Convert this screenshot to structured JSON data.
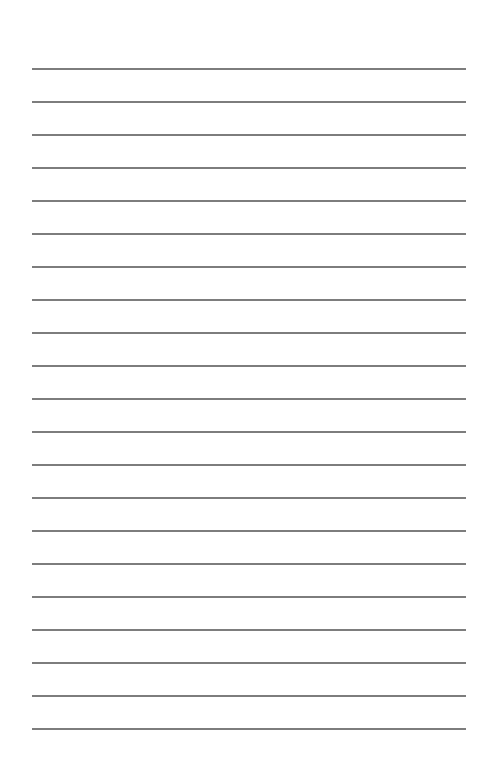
{
  "page": {
    "type": "lined-paper",
    "background_color": "#ffffff",
    "line_color": "#6f6f6f",
    "line_count": 21,
    "first_line_y": 68,
    "line_spacing": 33,
    "line_left": 32,
    "line_right": 466,
    "text_content": ""
  }
}
